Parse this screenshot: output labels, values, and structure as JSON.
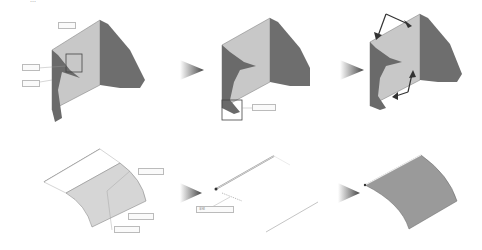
{
  "header": {
    "text": "…"
  },
  "steps": [
    {
      "id": 1,
      "labels": [
        "",
        "",
        ""
      ]
    },
    {
      "id": 2,
      "labels": [
        ""
      ]
    },
    {
      "id": 3,
      "labels": []
    },
    {
      "id": 4,
      "labels": [
        "",
        "",
        ""
      ]
    },
    {
      "id": 5,
      "labels": [
        "半径"
      ]
    },
    {
      "id": 6,
      "labels": []
    }
  ],
  "colors": {
    "face_light": "#c8c8c8",
    "face_dark": "#6e6e6e",
    "edge": "#555555",
    "arrow": "#555555",
    "surface": "#9a9a9a"
  }
}
